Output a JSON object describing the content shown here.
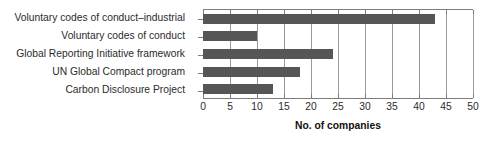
{
  "chart_data": {
    "type": "bar",
    "orientation": "horizontal",
    "title": "",
    "xlabel": "No. of companies",
    "ylabel": "",
    "categories": [
      "Voluntary codes of conduct–industrial",
      "Voluntary codes of conduct",
      "Global Reporting Initiative framework",
      "UN Global Compact program",
      "Carbon Disclosure Project"
    ],
    "values": [
      43,
      10,
      24,
      18,
      13
    ],
    "xlim": [
      0,
      50
    ],
    "xticks": [
      0,
      5,
      10,
      15,
      20,
      25,
      30,
      35,
      40,
      45,
      50
    ],
    "xtick_labels": [
      "0",
      "5",
      "10",
      "15",
      "20",
      "25",
      "30",
      "35",
      "40",
      "45",
      "50"
    ],
    "grid": true,
    "grid_axis": "x",
    "legend": false,
    "bar_color": "#565656",
    "grid_color": "#9a9a9a",
    "axis_color": "#7d7d7d",
    "text_color": "#2b2b2b"
  }
}
